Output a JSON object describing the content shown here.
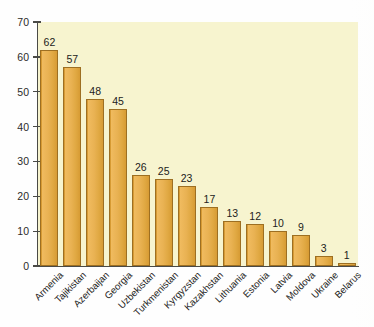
{
  "chart_data": {
    "type": "bar",
    "title": "",
    "subtitle": "",
    "xlabel": "",
    "ylabel": "",
    "ylim": [
      0,
      70
    ],
    "ytick_step": 10,
    "yticks": [
      "70",
      "60",
      "50",
      "40",
      "30",
      "20",
      "10",
      "0"
    ],
    "grid": false,
    "legend": null,
    "categories": [
      "Armenia",
      "Tajikistan",
      "Azerbaijan",
      "Georgia",
      "Uzbekistan",
      "Turkmenistan",
      "Kyrgyzstan",
      "Kazakhstan",
      "Lithuania",
      "Estonia",
      "Latvia",
      "Moldova",
      "Ukraine",
      "Belarus"
    ],
    "values": [
      62,
      57,
      48,
      45,
      26,
      25,
      23,
      17,
      13,
      12,
      10,
      9,
      3,
      1
    ],
    "value_labels": [
      "62",
      "57",
      "48",
      "45",
      "26",
      "25",
      "23",
      "17",
      "13",
      "12",
      "10",
      "9",
      "3",
      "1"
    ],
    "bar_color": "#e3ab48",
    "bar_edge_color": "#9d6f22",
    "plot_background": "#f7f4cf",
    "figure_background": "#fefefe",
    "axis_color": "#4a4a46",
    "text_color": "#1d1d1b",
    "label_rotation_degrees": -45
  }
}
